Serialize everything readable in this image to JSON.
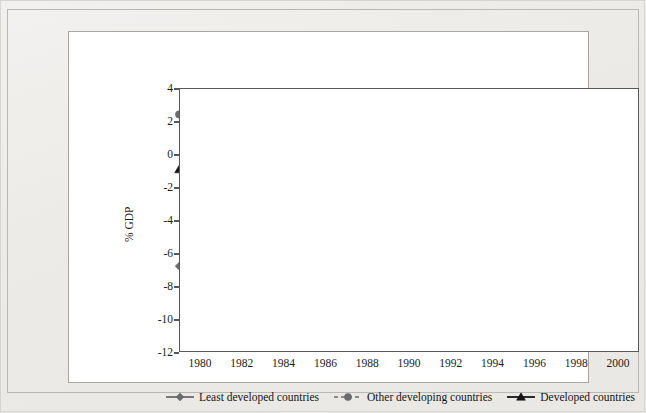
{
  "chart_data": {
    "type": "line",
    "title": "",
    "xlabel": "",
    "ylabel": "% GDP",
    "ylim": [
      -12,
      4
    ],
    "ytick_step": 2,
    "yticks": [
      4,
      2,
      0,
      -2,
      -4,
      -6,
      -8,
      -10,
      -12
    ],
    "xticks": [
      1980,
      1982,
      1984,
      1986,
      1988,
      1990,
      1992,
      1994,
      1996,
      1998,
      2000
    ],
    "xlim": [
      1979,
      2001
    ],
    "grid": "horizontal",
    "zero_line": true,
    "legend_position": "bottom",
    "x": [
      1979,
      1980,
      1981,
      1982,
      1983,
      1984,
      1985,
      1986,
      1987,
      1988,
      1989,
      1990,
      1991,
      1992,
      1993,
      1994,
      1995,
      1996,
      1997,
      1998,
      1999,
      2000,
      2001
    ],
    "series": [
      {
        "name": "Least developed countries",
        "marker": "diamond",
        "linestyle": "solid",
        "color": "#6b6b6d",
        "values": [
          -6.8,
          -8.7,
          -8.8,
          -7.0,
          -5.5,
          -5.6,
          -5.9,
          -6.5,
          -6.2,
          -6.1,
          -5.3,
          -7.0,
          -8.9,
          -9.0,
          -7.1,
          -9.4,
          -7.9,
          -7.3,
          -9.1,
          -8.3,
          -4.7,
          -6.3,
          null
        ]
      },
      {
        "name": "Other developing countries",
        "marker": "circle",
        "linestyle": "dashed",
        "color": "#6b6b6d",
        "values": [
          2.4,
          0.35,
          -0.7,
          -0.15,
          -0.1,
          0.4,
          -1.0,
          0.8,
          0.5,
          0.5,
          0.45,
          -0.5,
          -1.3,
          -1.6,
          -1.1,
          -0.8,
          -0.4,
          -0.1,
          0.3,
          1.4,
          2.1,
          1.8,
          null
        ]
      },
      {
        "name": "Developed countries",
        "marker": "triangle",
        "linestyle": "solid",
        "color": "#151515",
        "values": [
          -0.95,
          -0.5,
          -0.25,
          -0.65,
          -0.15,
          -0.55,
          -0.45,
          -0.2,
          -0.35,
          -0.3,
          -0.3,
          0.1,
          0.45,
          0.7,
          0.65,
          0.7,
          0.7,
          0.75,
          -0.05,
          -0.45,
          -0.7,
          -0.5,
          null
        ]
      }
    ]
  },
  "legend": {
    "items": [
      {
        "label": "Least developed countries",
        "marker": "diamond",
        "linestyle": "solid",
        "color": "#6b6b6d"
      },
      {
        "label": "Other developing countries",
        "marker": "circle",
        "linestyle": "dashed",
        "color": "#6b6b6d"
      },
      {
        "label": "Developed countries",
        "marker": "triangle",
        "linestyle": "solid",
        "color": "#151515"
      }
    ]
  },
  "axes": {
    "y_title": "% GDP",
    "y_labels": [
      "4",
      "2",
      "0",
      "-2",
      "-4",
      "-6",
      "-8",
      "-10",
      "-12"
    ],
    "x_labels": [
      "1980",
      "1982",
      "1984",
      "1986",
      "1988",
      "1990",
      "1992",
      "1994",
      "1996",
      "1998",
      "2000"
    ]
  }
}
